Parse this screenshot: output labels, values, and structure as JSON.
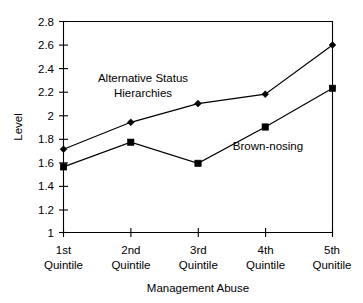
{
  "chart_data": {
    "type": "line",
    "title": "",
    "xlabel": "Management Abuse",
    "ylabel": "Level",
    "categories": [
      "1st Quintile",
      "2nd Quintile",
      "3rd Quintile",
      "4th Quintile",
      "5th Qunitile"
    ],
    "category_lines": [
      [
        "1st",
        "Quintile"
      ],
      [
        "2nd",
        "Quintile"
      ],
      [
        "3rd",
        "Quintile"
      ],
      [
        "4th",
        "Quintile"
      ],
      [
        "5th",
        "Qunitile"
      ]
    ],
    "ylim": [
      1,
      2.8
    ],
    "ytick_labels": [
      "2.8",
      "2.6",
      "2.4",
      "2.2",
      "2",
      "1.8",
      "1.6",
      "1.4",
      "1.2",
      "1"
    ],
    "ytick_values": [
      2.8,
      2.6,
      2.4,
      2.2,
      2.0,
      1.8,
      1.6,
      1.4,
      1.2,
      1.0
    ],
    "grid": false,
    "legend_position": "inline-annotation",
    "series": [
      {
        "name": "Alternative Status Hierarchies",
        "marker": "diamond",
        "color": "#000000",
        "values": [
          1.71,
          1.94,
          2.1,
          2.18,
          2.6
        ]
      },
      {
        "name": "Brown-nosing",
        "marker": "square",
        "color": "#000000",
        "values": [
          1.56,
          1.77,
          1.59,
          1.9,
          2.23
        ]
      }
    ],
    "annotations": [
      {
        "id": "alternative-status-hierarchies",
        "lines": [
          "Alternative Status",
          "Hierarchies"
        ],
        "x": 143,
        "y": 82
      },
      {
        "id": "brown-nosing",
        "lines": [
          "Brown-nosing"
        ],
        "x": 268,
        "y": 150
      }
    ]
  }
}
